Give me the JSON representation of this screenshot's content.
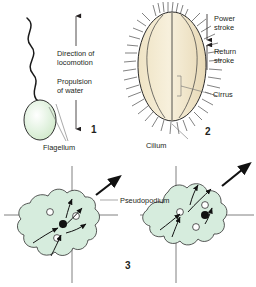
{
  "figure": {
    "background_color": "#ffffff",
    "ink_color": "#231f20",
    "cell_green": "#d6ecdd",
    "cell_cream": "#f2e8cf"
  },
  "panels": [
    {
      "number": "1",
      "name": "flagellum-panel",
      "organism": "flagellate",
      "labels": {
        "direction": "Direction of\nlocomotion",
        "direction_line1": "Direction of",
        "direction_line2": "locomotion",
        "propulsion_line1": "Propulsion",
        "propulsion_line2": "of water",
        "structure": "Flagellum"
      },
      "arrows": [
        {
          "name": "direction-of-locomotion-arrow",
          "points": "up"
        },
        {
          "name": "propulsion-of-water-arrow",
          "points": "down"
        }
      ]
    },
    {
      "number": "2",
      "name": "cilium-panel",
      "organism": "ciliate",
      "labels": {
        "power_line1": "Power",
        "power_line2": "stroke",
        "return_line1": "Return",
        "return_line2": "stroke",
        "cirrus": "Cirrus",
        "cilium": "Cilium"
      },
      "arrows": [
        {
          "name": "power-stroke-arrow",
          "points": "down"
        },
        {
          "name": "return-stroke-arrow",
          "points": "up"
        }
      ]
    },
    {
      "number": "3",
      "name": "pseudopodium-panel",
      "organism": "amoeba",
      "labels": {
        "structure": "Pseudopodium"
      },
      "stages": [
        {
          "name": "amoeba-stage-left",
          "movement": "up-right"
        },
        {
          "name": "amoeba-stage-right",
          "movement": "up-right"
        }
      ]
    }
  ]
}
